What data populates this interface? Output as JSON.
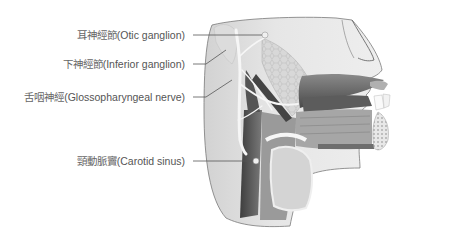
{
  "diagram": {
    "labels": [
      {
        "id": "otic-ganglion",
        "cjk": "耳神經節",
        "latin": "(Otic ganglion)"
      },
      {
        "id": "inferior-ganglion",
        "cjk": "下神經節",
        "latin": "(Inferior ganglion)"
      },
      {
        "id": "glossopharyngeal-nerve",
        "cjk": "舌咽神經",
        "latin": "(Glossopharyngeal nerve)"
      },
      {
        "id": "carotid-sinus",
        "cjk": "頸動脈竇",
        "latin": "(Carotid sinus)"
      }
    ],
    "colors": {
      "background": "#ffffff",
      "tissue_light": "#e6e6e6",
      "tissue_mid": "#b5b5b5",
      "tissue_dark": "#5a5a5a",
      "nerve": "#f4f4f4",
      "leader_line": "#555555",
      "label_text": "#555555"
    }
  }
}
